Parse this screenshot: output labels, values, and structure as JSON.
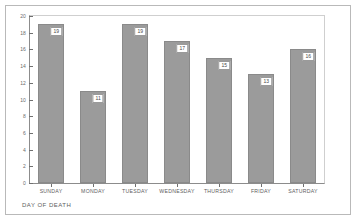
{
  "chart_data": {
    "type": "bar",
    "title": "",
    "subtitle": "",
    "categories": [
      "SUNDAY",
      "MONDAY",
      "TUESDAY",
      "WEDNESDAY",
      "THURSDAY",
      "FRIDAY",
      "SATURDAY"
    ],
    "values": [
      19,
      11,
      19,
      17,
      15,
      13,
      16
    ],
    "data_labels": [
      "19",
      "11",
      "19",
      "17",
      "15",
      "13",
      "16"
    ],
    "xlabel": "DAY OF DEATH",
    "ylabel": "",
    "ylim": [
      0,
      20
    ],
    "ytick_values": [
      0,
      2,
      4,
      6,
      8,
      10,
      12,
      14,
      16,
      18,
      20
    ],
    "ytick_labels": [
      "0",
      "2",
      "4",
      "6",
      "8",
      "10",
      "12",
      "14",
      "16",
      "18",
      "20"
    ],
    "grid": false,
    "legend": false,
    "legend_position": "none",
    "bar_color": "#9b9b9b",
    "bar_edge_color": "#8a8a8a",
    "axis_color": "#8c8c8c",
    "label_box_color": "#ffffff",
    "background": "#ffffff",
    "frame_color": "#b9b9b9"
  }
}
